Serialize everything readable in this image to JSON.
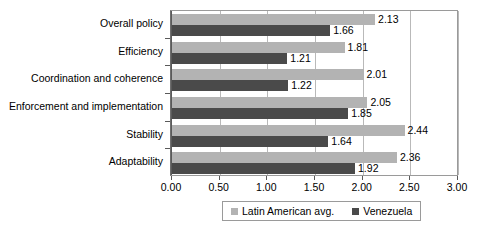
{
  "chart_data": {
    "type": "bar",
    "orientation": "horizontal",
    "title": "",
    "xlabel": "",
    "ylabel": "",
    "xlim": [
      0,
      3
    ],
    "xticks": [
      "0.00",
      "0.50",
      "1.00",
      "1.50",
      "2.00",
      "2.50",
      "3.00"
    ],
    "xtick_values": [
      0,
      0.5,
      1,
      1.5,
      2,
      2.5,
      3
    ],
    "grid": true,
    "legend_position": "bottom",
    "categories": [
      "Overall policy",
      "Efficiency",
      "Coordination and coherence",
      "Enforcement and implementation",
      "Stability",
      "Adaptability"
    ],
    "series": [
      {
        "name": "Latin American avg.",
        "color": "#b3b3b3",
        "values": [
          2.13,
          1.81,
          2.01,
          2.05,
          2.44,
          2.36
        ],
        "labels": [
          "2.13",
          "1.81",
          "2.01",
          "2.05",
          "2.44",
          "2.36"
        ]
      },
      {
        "name": "Venezuela",
        "color": "#4a4a4a",
        "values": [
          1.66,
          1.21,
          1.22,
          1.85,
          1.64,
          1.92
        ],
        "labels": [
          "1.66",
          "1.21",
          "1.22",
          "1.85",
          "1.64",
          "1.92"
        ]
      }
    ]
  },
  "legend": {
    "entries": [
      {
        "label": "Latin American avg.",
        "color": "#b3b3b3"
      },
      {
        "label": "Venezuela",
        "color": "#4a4a4a"
      }
    ]
  }
}
